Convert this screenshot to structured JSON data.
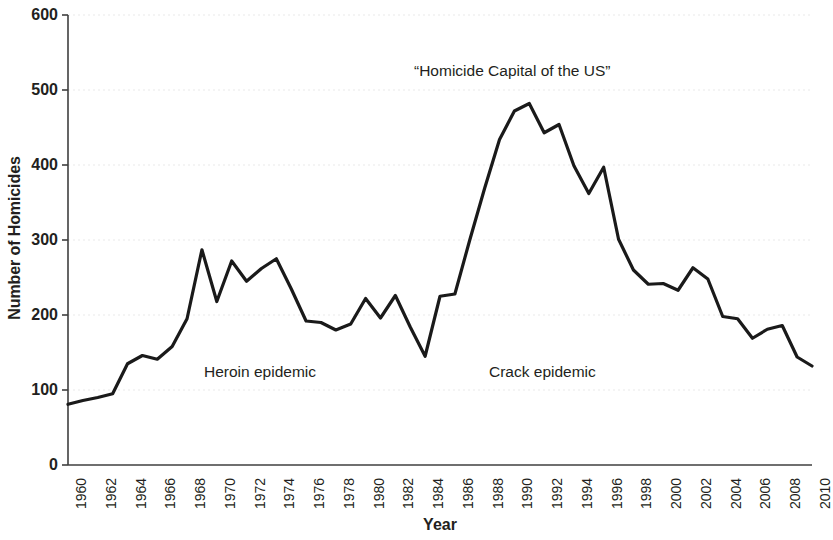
{
  "chart_data": {
    "type": "line",
    "title": "",
    "xlabel": "Year",
    "ylabel": "Number of Homicides",
    "xlim": [
      1960,
      2010
    ],
    "ylim": [
      0,
      600
    ],
    "yticks": [
      0,
      100,
      200,
      300,
      400,
      500,
      600
    ],
    "xticks": [
      1960,
      1962,
      1964,
      1966,
      1968,
      1970,
      1972,
      1974,
      1976,
      1978,
      1980,
      1982,
      1984,
      1986,
      1988,
      1990,
      1992,
      1994,
      1996,
      1998,
      2000,
      2002,
      2004,
      2006,
      2008,
      2010
    ],
    "grid": "horizontal-faint",
    "legend": "none",
    "line_color": "#1a1a1a",
    "line_width": 3.2,
    "x": [
      1960,
      1961,
      1962,
      1963,
      1964,
      1965,
      1966,
      1967,
      1968,
      1969,
      1970,
      1971,
      1972,
      1973,
      1974,
      1975,
      1976,
      1977,
      1978,
      1979,
      1980,
      1981,
      1982,
      1983,
      1984,
      1985,
      1986,
      1987,
      1988,
      1989,
      1990,
      1991,
      1992,
      1993,
      1994,
      1995,
      1996,
      1997,
      1998,
      1999,
      2000,
      2001,
      2002,
      2003,
      2004,
      2005,
      2006,
      2007,
      2008,
      2009,
      2010
    ],
    "values": [
      81,
      86,
      90,
      95,
      135,
      146,
      141,
      158,
      195,
      287,
      218,
      272,
      245,
      262,
      275,
      235,
      192,
      190,
      180,
      188,
      222,
      196,
      226,
      184,
      145,
      225,
      228,
      300,
      369,
      434,
      472,
      482,
      443,
      454,
      399,
      362,
      397,
      301,
      260,
      241,
      242,
      233,
      263,
      248,
      198,
      195,
      169,
      181,
      186,
      144,
      132
    ],
    "annotations": [
      {
        "id": "homicide-capital",
        "text": "“Homicide Capital of the US”",
        "x": 1991,
        "y": 530
      },
      {
        "id": "heroin-epidemic",
        "text": "Heroin epidemic",
        "x": 1970,
        "y": 135
      },
      {
        "id": "crack-epidemic",
        "text": "Crack epidemic",
        "x": 1989,
        "y": 135
      }
    ]
  },
  "axis": {
    "ylabel": "Number of Homicides",
    "xlabel": "Year",
    "yticks": [
      "600",
      "500",
      "400",
      "300",
      "200",
      "100",
      "0"
    ],
    "xticks": [
      "1960",
      "1962",
      "1964",
      "1966",
      "1968",
      "1970",
      "1972",
      "1974",
      "1976",
      "1978",
      "1980",
      "1982",
      "1984",
      "1986",
      "1988",
      "1990",
      "1992",
      "1994",
      "1996",
      "1998",
      "2000",
      "2002",
      "2004",
      "2006",
      "2008",
      "2010"
    ]
  },
  "annotations": {
    "homicide_capital": "“Homicide Capital of the US”",
    "heroin": "Heroin epidemic",
    "crack": "Crack epidemic"
  },
  "colors": {
    "line": "#1a1a1a",
    "axis": "#3f3f3f",
    "grid": "#e9e9e9",
    "text": "#231f20",
    "background": "#ffffff"
  }
}
